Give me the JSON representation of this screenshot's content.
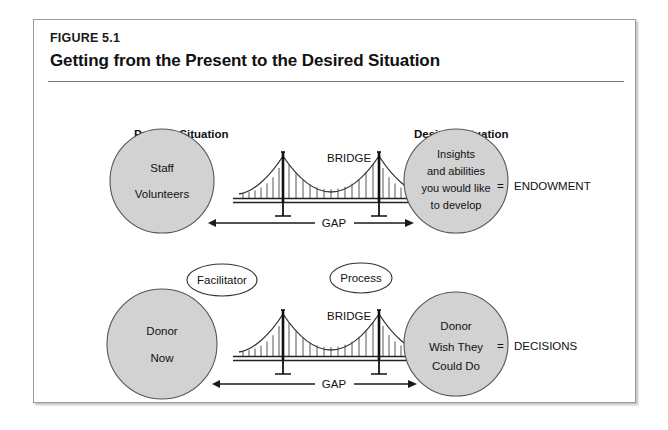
{
  "figure": {
    "label": "FIGURE 5.1",
    "title": "Getting from the Present to the Desired Situation"
  },
  "headings": {
    "present": "Present Situation",
    "desired": "Desired Situation"
  },
  "diagrams": [
    {
      "id": "endowment",
      "left_circle_lines": [
        "Staff",
        "Volunteers"
      ],
      "right_circle_lines": [
        "Insights",
        "and abilities",
        "you would like",
        "to develop"
      ],
      "bridge_label": "BRIDGE",
      "gap_label": "GAP",
      "result_equals": "=",
      "result_label": "ENDOWMENT",
      "callouts": []
    },
    {
      "id": "decisions",
      "left_circle_lines": [
        "Donor",
        "Now"
      ],
      "right_circle_lines": [
        "Donor",
        "Wish They",
        "Could Do"
      ],
      "bridge_label": "BRIDGE",
      "gap_label": "GAP",
      "result_equals": "=",
      "result_label": "DECISIONS",
      "callouts": [
        "Facilitator",
        "Process"
      ]
    }
  ],
  "colors": {
    "circle_fill": "#d2d2d2",
    "circle_stroke": "#555555",
    "frame_border": "#9a9a9a",
    "rule": "#7a7a7a",
    "text": "#111111",
    "bridge_stroke": "#333333"
  }
}
